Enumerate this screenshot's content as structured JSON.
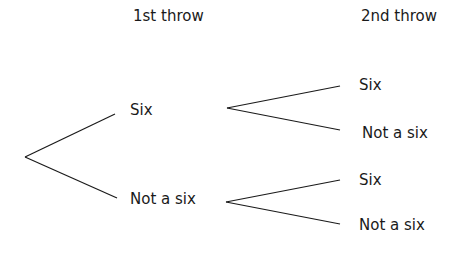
{
  "headers": {
    "first": "1st throw",
    "second": "2nd throw"
  },
  "tree": {
    "level1": [
      {
        "label": "Six",
        "children": [
          "Six",
          "Not a six"
        ]
      },
      {
        "label": "Not a six",
        "children": [
          "Six",
          "Not a six"
        ]
      }
    ]
  },
  "colors": {
    "line": "#1a1a1a",
    "text": "#1a1a1a",
    "background": "#ffffff"
  }
}
